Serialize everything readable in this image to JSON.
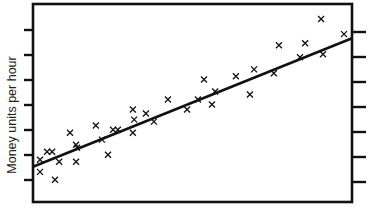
{
  "chart_data": {
    "type": "scatter",
    "title": "",
    "xlabel": "",
    "ylabel": "Money units per hour",
    "xlim": [
      0,
      100
    ],
    "ylim": [
      0,
      100
    ],
    "grid": false,
    "legend": null,
    "frame": "box",
    "y_ticks_left": 7,
    "y_ticks_right": 7,
    "tick_labels": false,
    "marker": "x",
    "points": [
      {
        "x": 2.2,
        "y": 21.3
      },
      {
        "x": 2.2,
        "y": 15.2
      },
      {
        "x": 4.4,
        "y": 25.4
      },
      {
        "x": 6.0,
        "y": 25.4
      },
      {
        "x": 6.9,
        "y": 11.2
      },
      {
        "x": 8.2,
        "y": 20.3
      },
      {
        "x": 11.6,
        "y": 35.0
      },
      {
        "x": 13.5,
        "y": 28.9
      },
      {
        "x": 13.5,
        "y": 20.3
      },
      {
        "x": 13.8,
        "y": 27.4
      },
      {
        "x": 19.7,
        "y": 38.6
      },
      {
        "x": 21.6,
        "y": 31.5
      },
      {
        "x": 23.5,
        "y": 23.9
      },
      {
        "x": 25.1,
        "y": 36.5
      },
      {
        "x": 26.6,
        "y": 36.5
      },
      {
        "x": 31.3,
        "y": 46.7
      },
      {
        "x": 31.7,
        "y": 41.6
      },
      {
        "x": 31.3,
        "y": 35.0
      },
      {
        "x": 35.4,
        "y": 44.7
      },
      {
        "x": 37.9,
        "y": 40.6
      },
      {
        "x": 42.3,
        "y": 51.8
      },
      {
        "x": 48.3,
        "y": 46.7
      },
      {
        "x": 51.7,
        "y": 51.8
      },
      {
        "x": 53.6,
        "y": 61.9
      },
      {
        "x": 56.1,
        "y": 49.2
      },
      {
        "x": 57.1,
        "y": 55.8
      },
      {
        "x": 63.6,
        "y": 63.5
      },
      {
        "x": 68.0,
        "y": 54.3
      },
      {
        "x": 69.3,
        "y": 67.0
      },
      {
        "x": 75.5,
        "y": 65.0
      },
      {
        "x": 77.1,
        "y": 79.2
      },
      {
        "x": 83.7,
        "y": 73.1
      },
      {
        "x": 85.3,
        "y": 80.2
      },
      {
        "x": 90.3,
        "y": 92.4
      },
      {
        "x": 90.9,
        "y": 74.6
      },
      {
        "x": 97.5,
        "y": 84.8
      }
    ],
    "trendline": {
      "x": [
        0,
        100
      ],
      "y": [
        17.8,
        82.7
      ]
    }
  }
}
